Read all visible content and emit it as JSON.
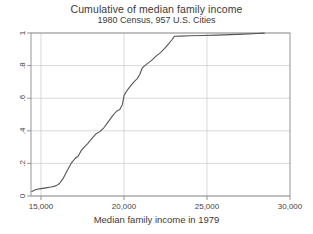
{
  "chart_data": {
    "type": "line",
    "title": "Cumulative of median family income",
    "subtitle": "1980 Census, 957 U.S. Cities",
    "xlabel": "Median family income in 1979",
    "ylabel": "",
    "xlim": [
      14400,
      30000
    ],
    "ylim": [
      0,
      1
    ],
    "grid": true,
    "grid_axis": "y",
    "legend": "none",
    "line_color": "#555555",
    "xticks": [
      15000,
      20000,
      25000,
      30000
    ],
    "xtick_labels": [
      "15,000",
      "20,000",
      "25,000",
      "30,000"
    ],
    "yticks": [
      0,
      0.2,
      0.4,
      0.6,
      0.8,
      1
    ],
    "ytick_labels": [
      "0",
      ".2",
      ".4",
      ".6",
      ".8",
      "1"
    ],
    "series": [
      {
        "name": "Cumulative proportion",
        "x": [
          14450,
          14700,
          15000,
          15300,
          15600,
          15900,
          16100,
          16350,
          16600,
          16850,
          17050,
          17250,
          17400,
          17600,
          17800,
          18050,
          18300,
          18550,
          18800,
          19050,
          19300,
          19550,
          19750,
          19900,
          19980,
          20000,
          20050,
          20200,
          20400,
          20600,
          20800,
          20950,
          21100,
          21250,
          21450,
          21700,
          21950,
          22200,
          22450,
          22700,
          22900,
          23000,
          23050,
          23400,
          24000,
          24800,
          25600,
          26400,
          27200,
          28000,
          28450
        ],
        "y": [
          0.028,
          0.04,
          0.045,
          0.05,
          0.055,
          0.062,
          0.075,
          0.11,
          0.16,
          0.205,
          0.23,
          0.245,
          0.275,
          0.3,
          0.32,
          0.35,
          0.38,
          0.395,
          0.42,
          0.455,
          0.49,
          0.52,
          0.53,
          0.56,
          0.6,
          0.615,
          0.625,
          0.65,
          0.675,
          0.7,
          0.72,
          0.745,
          0.785,
          0.8,
          0.815,
          0.835,
          0.86,
          0.88,
          0.905,
          0.935,
          0.96,
          0.975,
          0.98,
          0.981,
          0.983,
          0.985,
          0.987,
          0.99,
          0.993,
          0.997,
          0.999
        ]
      }
    ]
  },
  "plot_box": {
    "left": 31,
    "top": 33,
    "right": 290,
    "bottom": 196
  }
}
